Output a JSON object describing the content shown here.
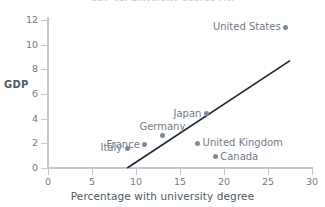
{
  "chart_data": {
    "type": "scatter",
    "title": "GDP vs. university degree (%)",
    "xlabel": "Percentage with university degree",
    "ylabel": "GDP",
    "xlim": [
      0,
      30
    ],
    "ylim": [
      0,
      12
    ],
    "xticks": [
      "0",
      "5",
      "10",
      "15",
      "20",
      "25",
      "30"
    ],
    "yticks": [
      "0",
      "2",
      "4",
      "6",
      "8",
      "10",
      "12"
    ],
    "grid": false,
    "legend": "none",
    "marker_color": "#7f8a99",
    "trendline_color": "#1b2438",
    "axis_color": "#c3c8cf",
    "label_color": "#6f7b88",
    "points": [
      {
        "name": "Italy",
        "x": 9,
        "y": 1.6,
        "label_position": "left"
      },
      {
        "name": "France",
        "x": 11,
        "y": 1.9,
        "label_position": "left"
      },
      {
        "name": "Germany",
        "x": 13,
        "y": 2.6,
        "label_position": "above"
      },
      {
        "name": "United Kingdom",
        "x": 17,
        "y": 2.0,
        "label_position": "right"
      },
      {
        "name": "Japan",
        "x": 18,
        "y": 4.4,
        "label_position": "left"
      },
      {
        "name": "Canada",
        "x": 19,
        "y": 0.9,
        "label_position": "right"
      },
      {
        "name": "United States",
        "x": 27,
        "y": 11.4,
        "label_position": "left"
      }
    ],
    "trendline": {
      "x0": 9,
      "y0": 0,
      "x1": 27.5,
      "y1": 8.7
    }
  }
}
